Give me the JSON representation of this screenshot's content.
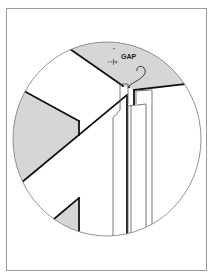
{
  "figure": {
    "type": "technical-illustration",
    "annotation": {
      "fraction_numerator": "1",
      "fraction_denominator": "4",
      "unit_mark": "\"",
      "text": "GAP"
    },
    "colors": {
      "frame_border": "#9a9a9a",
      "outline": "#111111",
      "shade": "#d6d6d6",
      "background": "#ffffff"
    }
  }
}
